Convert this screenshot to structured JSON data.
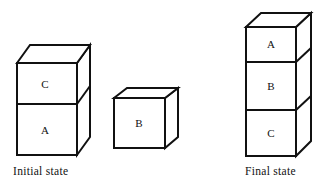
{
  "figure": {
    "background_color": "#ffffff",
    "line_color": "#111111",
    "face_color": "#ffffff"
  },
  "captions": {
    "initial": "Initial state",
    "final": "Final state"
  },
  "scenes": [
    {
      "name": "initial-state",
      "caption": "Initial state",
      "stacks": [
        {
          "name": "left-stack",
          "blocks_bottom_to_top": [
            "A",
            "C"
          ],
          "labels": {
            "top": "C",
            "bottom": "A"
          }
        },
        {
          "name": "middle-block",
          "blocks_bottom_to_top": [
            "B"
          ],
          "labels": {
            "single": "B"
          }
        }
      ]
    },
    {
      "name": "final-state",
      "caption": "Final state",
      "stacks": [
        {
          "name": "right-stack",
          "blocks_bottom_to_top": [
            "C",
            "B",
            "A"
          ],
          "labels": {
            "top": "A",
            "middle": "B",
            "bottom": "C"
          }
        }
      ]
    }
  ],
  "blocks": {
    "left_top": "C",
    "left_bottom": "A",
    "middle": "B",
    "right_top": "A",
    "right_middle": "B",
    "right_bottom": "C"
  }
}
